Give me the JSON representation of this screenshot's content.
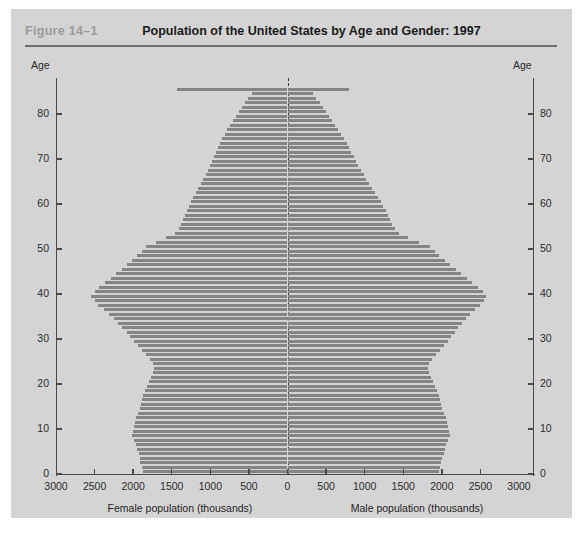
{
  "figure": {
    "label": "Figure 14–1",
    "title": "Population of the United States by Age and Gender: 1997"
  },
  "axes": {
    "y_title_left": "Age",
    "y_title_right": "Age",
    "y_ticks": [
      0,
      10,
      20,
      30,
      40,
      50,
      60,
      70,
      80
    ],
    "x_ticks_labels": [
      "3000",
      "2500",
      "2000",
      "1500",
      "1000",
      "500",
      "0",
      "500",
      "1000",
      "1500",
      "2000",
      "2500",
      "3000"
    ],
    "x_caption_left": "Female population (thousands)",
    "x_caption_right": "Male population (thousands)"
  },
  "colors": {
    "panel": "#d4d4d4",
    "bar": "#848484",
    "axis": "#4a4a4a",
    "label_gray": "#9a9a9a",
    "title": "#1a1a1a"
  },
  "chart_data": {
    "type": "bar",
    "orientation": "population-pyramid",
    "title": "Population of the United States by Age and Gender: 1997",
    "xlabel_left": "Female population (thousands)",
    "xlabel_right": "Male population (thousands)",
    "ylabel": "Age",
    "xlim": [
      0,
      3000
    ],
    "ylim": [
      0,
      85
    ],
    "grid": false,
    "units": "thousands",
    "ages": [
      0,
      1,
      2,
      3,
      4,
      5,
      6,
      7,
      8,
      9,
      10,
      11,
      12,
      13,
      14,
      15,
      16,
      17,
      18,
      19,
      20,
      21,
      22,
      23,
      24,
      25,
      26,
      27,
      28,
      29,
      30,
      31,
      32,
      33,
      34,
      35,
      36,
      37,
      38,
      39,
      40,
      41,
      42,
      43,
      44,
      45,
      46,
      47,
      48,
      49,
      50,
      51,
      52,
      53,
      54,
      55,
      56,
      57,
      58,
      59,
      60,
      61,
      62,
      63,
      64,
      65,
      66,
      67,
      68,
      69,
      70,
      71,
      72,
      73,
      74,
      75,
      76,
      77,
      78,
      79,
      80,
      81,
      82,
      83,
      84,
      85
    ],
    "series": [
      {
        "name": "Female population (thousands)",
        "side": "left",
        "values": [
          1873,
          1890,
          1905,
          1915,
          1930,
          1945,
          1960,
          1985,
          2010,
          2000,
          1985,
          1975,
          1960,
          1940,
          1915,
          1900,
          1885,
          1870,
          1845,
          1820,
          1800,
          1770,
          1745,
          1730,
          1740,
          1780,
          1835,
          1890,
          1940,
          1985,
          2035,
          2085,
          2140,
          2195,
          2250,
          2310,
          2380,
          2450,
          2500,
          2540,
          2500,
          2440,
          2360,
          2290,
          2220,
          2150,
          2080,
          2010,
          1945,
          1890,
          1840,
          1700,
          1570,
          1460,
          1405,
          1380,
          1350,
          1330,
          1305,
          1280,
          1255,
          1220,
          1190,
          1155,
          1120,
          1090,
          1060,
          1030,
          1005,
          980,
          955,
          925,
          900,
          875,
          845,
          815,
          780,
          745,
          705,
          670,
          630,
          590,
          550,
          510,
          465,
          1430
        ]
      },
      {
        "name": "Male population (thousands)",
        "side": "right",
        "values": [
          1962,
          1980,
          1995,
          2008,
          2022,
          2035,
          2050,
          2075,
          2100,
          2090,
          2075,
          2065,
          2050,
          2030,
          2005,
          1990,
          1975,
          1960,
          1935,
          1910,
          1890,
          1860,
          1835,
          1820,
          1830,
          1870,
          1925,
          1980,
          2030,
          2075,
          2120,
          2165,
          2215,
          2265,
          2315,
          2370,
          2435,
          2500,
          2540,
          2575,
          2535,
          2475,
          2395,
          2325,
          2250,
          2180,
          2105,
          2035,
          1965,
          1905,
          1850,
          1700,
          1565,
          1450,
          1390,
          1360,
          1325,
          1300,
          1270,
          1240,
          1210,
          1170,
          1135,
          1095,
          1055,
          1020,
          985,
          950,
          920,
          890,
          860,
          825,
          795,
          765,
          730,
          695,
          655,
          615,
          575,
          535,
          495,
          455,
          415,
          375,
          335,
          800
        ]
      }
    ]
  }
}
